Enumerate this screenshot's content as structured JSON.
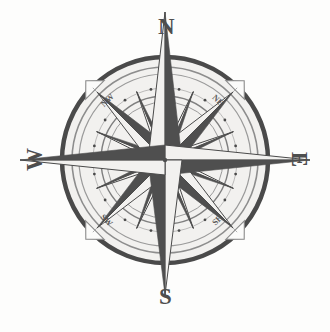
{
  "figure": {
    "kind": "compass-rose",
    "background_color": "#fdfdfc",
    "ink_color": "#4a4a4a",
    "dark_fill": "#4f4f4f",
    "light_fill": "#f2f1ef",
    "center": {
      "x": 165,
      "y": 160
    },
    "rings": [
      {
        "name": "outer-ring",
        "radius": 103,
        "stroke_width": 4.5,
        "color": "#4a4a4a"
      },
      {
        "name": "second-ring",
        "radius": 93,
        "stroke_width": 1.6,
        "color": "#8d8d8d"
      },
      {
        "name": "third-ring",
        "radius": 86,
        "stroke_width": 1.2,
        "color": "#9a9a9a"
      },
      {
        "name": "dotted-ring",
        "radius": 72,
        "stroke_width": 1.0,
        "color": "#8d8d8d"
      },
      {
        "name": "inner-ring",
        "radius": 64,
        "stroke_width": 1.4,
        "color": "#7f7f7f"
      },
      {
        "name": "innermost-ring",
        "radius": 58,
        "stroke_width": 1.0,
        "color": "#9a9a9a"
      }
    ],
    "dot_count": 16,
    "dot_radius": 1.4
  },
  "labels": {
    "cardinal": [
      {
        "id": "lab-n",
        "text": "N",
        "bearing_deg": 0,
        "name": "compass-label-north"
      },
      {
        "id": "lab-e",
        "text": "E",
        "bearing_deg": 90,
        "name": "compass-label-east"
      },
      {
        "id": "lab-s",
        "text": "S",
        "bearing_deg": 180,
        "name": "compass-label-south"
      },
      {
        "id": "lab-w",
        "text": "W",
        "bearing_deg": 270,
        "name": "compass-label-west"
      }
    ],
    "ordinal": [
      {
        "id": "lab-nw",
        "text": "NW",
        "bearing_deg": 315,
        "name": "compass-label-northwest"
      },
      {
        "id": "lab-ne",
        "text": "NE",
        "bearing_deg": 45,
        "name": "compass-label-northeast"
      },
      {
        "id": "lab-sw",
        "text": "SW",
        "bearing_deg": 225,
        "name": "compass-label-southwest"
      },
      {
        "id": "lab-se",
        "text": "SE",
        "bearing_deg": 135,
        "name": "compass-label-southeast"
      }
    ]
  },
  "star": {
    "major_points": [
      {
        "name": "north-point",
        "bearing_deg": 0,
        "length": 148,
        "half_width": 17
      },
      {
        "name": "east-point",
        "bearing_deg": 90,
        "length": 145,
        "half_width": 15
      },
      {
        "name": "south-point",
        "bearing_deg": 180,
        "length": 135,
        "half_width": 17
      },
      {
        "name": "west-point",
        "bearing_deg": 270,
        "length": 145,
        "half_width": 15
      }
    ],
    "diagonal_points": [
      {
        "name": "northeast-point",
        "bearing_deg": 45,
        "length": 96,
        "half_width": 13
      },
      {
        "name": "southeast-point",
        "bearing_deg": 135,
        "length": 96,
        "half_width": 13
      },
      {
        "name": "southwest-point",
        "bearing_deg": 225,
        "length": 96,
        "half_width": 13
      },
      {
        "name": "northwest-point",
        "bearing_deg": 315,
        "length": 96,
        "half_width": 13
      }
    ],
    "minor_rays": [
      {
        "name": "ray-nne",
        "bearing_deg": 22.5,
        "length": 74,
        "half_width": 5
      },
      {
        "name": "ray-ene",
        "bearing_deg": 67.5,
        "length": 74,
        "half_width": 5
      },
      {
        "name": "ray-ese",
        "bearing_deg": 112.5,
        "length": 74,
        "half_width": 5
      },
      {
        "name": "ray-sse",
        "bearing_deg": 157.5,
        "length": 74,
        "half_width": 5
      },
      {
        "name": "ray-ssw",
        "bearing_deg": 202.5,
        "length": 74,
        "half_width": 5
      },
      {
        "name": "ray-wsw",
        "bearing_deg": 247.5,
        "length": 74,
        "half_width": 5
      },
      {
        "name": "ray-wnw",
        "bearing_deg": 292.5,
        "length": 74,
        "half_width": 5
      },
      {
        "name": "ray-nnw",
        "bearing_deg": 337.5,
        "length": 74,
        "half_width": 5
      }
    ]
  },
  "tick_markers": [
    {
      "name": "tick-marker-northwest",
      "bearing_deg": 315
    },
    {
      "name": "tick-marker-northeast",
      "bearing_deg": 45
    },
    {
      "name": "tick-marker-southeast",
      "bearing_deg": 135
    },
    {
      "name": "tick-marker-southwest",
      "bearing_deg": 225
    }
  ]
}
